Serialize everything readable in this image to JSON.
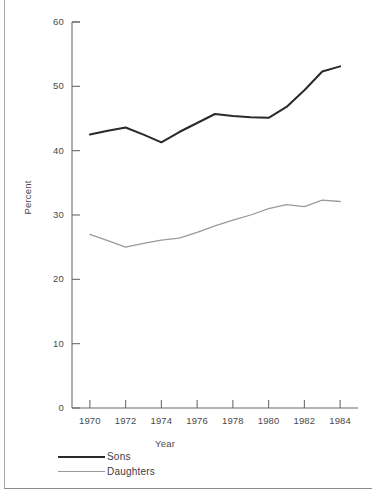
{
  "chart_data": {
    "type": "line",
    "title": "",
    "xlabel": "Year",
    "ylabel": "Percent",
    "xlim": [
      1969,
      1985
    ],
    "ylim": [
      0,
      60
    ],
    "grid": false,
    "legend_position": "bottom-left",
    "x": [
      1970,
      1971,
      1972,
      1973,
      1974,
      1975,
      1976,
      1977,
      1978,
      1979,
      1980,
      1981,
      1982,
      1983,
      1984
    ],
    "xticks": [
      "1970",
      "1972",
      "1974",
      "1976",
      "1978",
      "1980",
      "1982",
      "1984"
    ],
    "xtick_values": [
      1970,
      1972,
      1974,
      1976,
      1978,
      1980,
      1982,
      1984
    ],
    "yticks": [
      "0",
      "10",
      "20",
      "30",
      "40",
      "50",
      "60"
    ],
    "ytick_values": [
      0,
      10,
      20,
      30,
      40,
      50,
      60
    ],
    "series": [
      {
        "name": "Sons",
        "color": "#2a2a2a",
        "values": [
          42.5,
          43.1,
          43.6,
          42.5,
          41.3,
          42.9,
          44.3,
          45.7,
          45.4,
          45.2,
          45.1,
          46.8,
          49.4,
          52.3,
          53.1
        ]
      },
      {
        "name": "Daughters",
        "color": "#9a9a9a",
        "values": [
          27.0,
          26.0,
          25.0,
          25.6,
          26.1,
          26.4,
          27.3,
          28.3,
          29.2,
          30.0,
          31.0,
          31.6,
          31.3,
          32.3,
          32.1
        ]
      }
    ]
  },
  "legend": {
    "items": [
      {
        "label": "Sons",
        "color": "#2a2a2a"
      },
      {
        "label": "Daughters",
        "color": "#9a9a9a"
      }
    ]
  },
  "axis": {
    "x_title": "Year",
    "y_title": "Percent"
  }
}
